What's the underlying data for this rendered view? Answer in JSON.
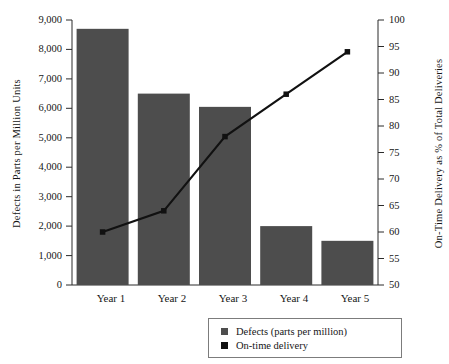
{
  "chart_data": {
    "type": "bar",
    "title": "",
    "subtitle": "",
    "categories": [
      "Year 1",
      "Year 2",
      "Year 3",
      "Year 4",
      "Year 5"
    ],
    "xlabel": "",
    "ylabel": "Defects in Parts per Million Units",
    "ylabel_secondary": "On-Time Delivery as % of Total Deliveries",
    "ylim": [
      0,
      9000
    ],
    "ylim_secondary": [
      50,
      100
    ],
    "yticks": [
      0,
      1000,
      2000,
      3000,
      4000,
      5000,
      6000,
      7000,
      8000,
      9000
    ],
    "ytick_labels": [
      "0",
      "1,000",
      "2,000",
      "3,000",
      "4,000",
      "5,000",
      "6,000",
      "7,000",
      "8,000",
      "9,000"
    ],
    "yticks_secondary": [
      50,
      55,
      60,
      65,
      70,
      75,
      80,
      85,
      90,
      95,
      100
    ],
    "ytick_labels_secondary": [
      "50",
      "55",
      "60",
      "65",
      "70",
      "75",
      "80",
      "85",
      "90",
      "95",
      "100"
    ],
    "grid": false,
    "legend_position": "bottom-right",
    "series": [
      {
        "name": "Defects (parts per million)",
        "type": "bar",
        "axis": "left",
        "color": "#4d4d4d",
        "values": [
          8700,
          6500,
          6050,
          2000,
          1500
        ]
      },
      {
        "name": "On-time delivery",
        "type": "line",
        "axis": "right",
        "color": "#111111",
        "values": [
          60,
          64,
          78,
          86,
          94
        ]
      }
    ]
  },
  "legend": {
    "items": [
      {
        "label": "Defects (parts per million)",
        "color": "#4d4d4d",
        "marker": "square"
      },
      {
        "label": "On-time delivery",
        "color": "#111111",
        "marker": "square"
      }
    ]
  }
}
